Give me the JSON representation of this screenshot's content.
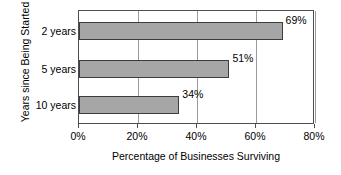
{
  "chart_data": {
    "type": "bar",
    "orientation": "horizontal",
    "title": "",
    "xlabel": "Percentage of Businesses Surviving",
    "ylabel": "Years since Being Started",
    "categories": [
      "2 years",
      "5 years",
      "10 years"
    ],
    "values": [
      69,
      51,
      34
    ],
    "value_labels": [
      "69%",
      "51%",
      "34%"
    ],
    "xlim": [
      0,
      80
    ],
    "xticks": [
      0,
      20,
      40,
      60,
      80
    ],
    "xtick_labels": [
      "0%",
      "20%",
      "40%",
      "60%",
      "80%"
    ],
    "grid": "vertical",
    "legend": "none",
    "bar_fill_color": "#a6a6a6",
    "bar_border_color": "#3d3d3d",
    "gridline_color": "#9a9a9a",
    "frame_color": "#4d4d4d",
    "background_color": "#ffffff",
    "text_color": "#000000"
  }
}
